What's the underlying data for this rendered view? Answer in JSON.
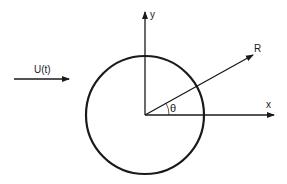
{
  "diagram": {
    "labels": {
      "flow": "U(t)",
      "y_axis": "y",
      "x_axis": "x",
      "radius": "R",
      "angle": "θ"
    },
    "colors": {
      "stroke": "#1a1a1a",
      "background": "#ffffff"
    }
  }
}
